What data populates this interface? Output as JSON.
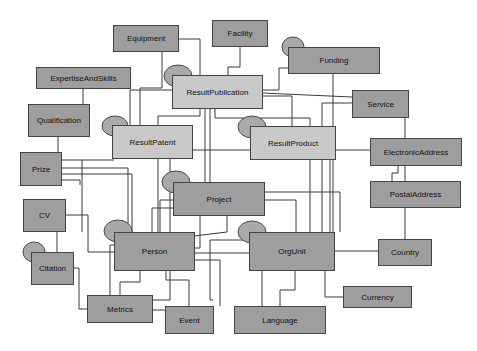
{
  "diagram": {
    "entities": {
      "equipment": {
        "label": "Equipment",
        "shade": "dark"
      },
      "facility": {
        "label": "Facility",
        "shade": "dark"
      },
      "funding": {
        "label": "Funding",
        "shade": "dark"
      },
      "expertise": {
        "label": "ExpertiseAndSkills",
        "shade": "dark"
      },
      "result_publication": {
        "label": "ResultPublication",
        "shade": "light"
      },
      "service": {
        "label": "Service",
        "shade": "dark"
      },
      "qualification": {
        "label": "Qualification",
        "shade": "dark"
      },
      "result_patent": {
        "label": "ResultPatent",
        "shade": "light"
      },
      "result_product": {
        "label": "ResultProduct",
        "shade": "light"
      },
      "electronic_address": {
        "label": "ElectronicAddress",
        "shade": "dark"
      },
      "prize": {
        "label": "Prize",
        "shade": "dark"
      },
      "project": {
        "label": "Project",
        "shade": "dark"
      },
      "postal_address": {
        "label": "PostalAddress",
        "shade": "dark"
      },
      "cv": {
        "label": "CV",
        "shade": "dark"
      },
      "person": {
        "label": "Person",
        "shade": "dark"
      },
      "orgunit": {
        "label": "OrgUnit",
        "shade": "dark"
      },
      "country": {
        "label": "Country",
        "shade": "dark"
      },
      "citation": {
        "label": "Citation",
        "shade": "dark"
      },
      "currency": {
        "label": "Currency",
        "shade": "dark"
      },
      "metrics": {
        "label": "Metrics",
        "shade": "dark"
      },
      "event": {
        "label": "Event",
        "shade": "dark"
      },
      "language": {
        "label": "Language",
        "shade": "dark"
      }
    },
    "colors": {
      "dark_entity": "#9e9e9e",
      "light_entity": "#c9c9c9",
      "oval": "#a9a9a9",
      "line": "#3a3a3a",
      "background": "#ffffff"
    }
  }
}
